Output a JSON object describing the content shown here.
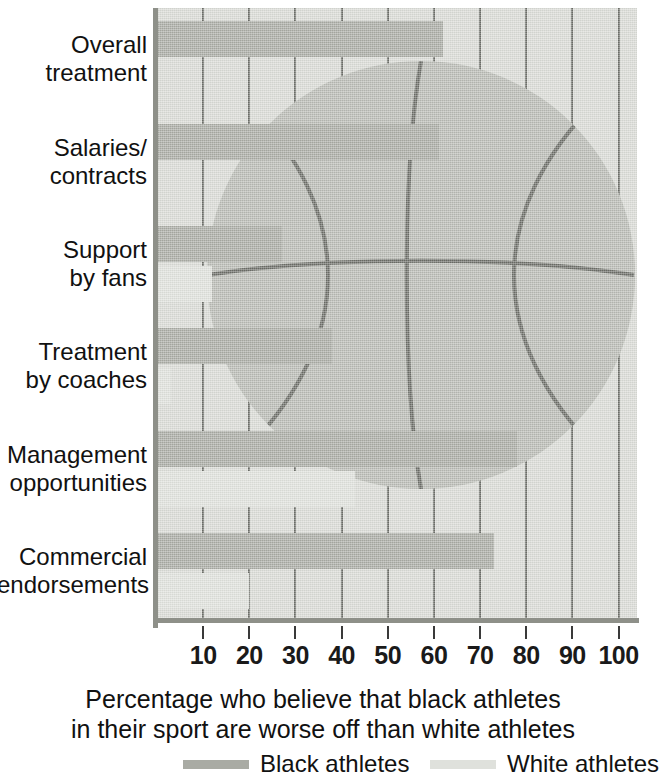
{
  "chart_data": {
    "type": "bar",
    "orientation": "horizontal",
    "title": "",
    "subtitle": "",
    "xlabel": "Percentage who believe that black athletes in their sport are worse off than white athletes",
    "ylabel": "",
    "xlim": [
      0,
      104
    ],
    "xticks": [
      10,
      20,
      30,
      40,
      50,
      60,
      70,
      80,
      90,
      100
    ],
    "xticklabels": [
      "10",
      "20",
      "30",
      "40",
      "50",
      "60",
      "70",
      "80",
      "90",
      "100"
    ],
    "grid": true,
    "grid_axis": "x",
    "legend_position": "bottom",
    "categories": [
      "Overall\ntreatment",
      "Salaries/\ncontracts",
      "Support\nby fans",
      "Treatment\nby coaches",
      "Management\nopportunities",
      "Commercial\nendorsements"
    ],
    "series": [
      {
        "name": "Black athletes",
        "color": "#a9aba4",
        "values": [
          62,
          61,
          27,
          38,
          78,
          73
        ]
      },
      {
        "name": "White athletes",
        "color": "#dfe1dc",
        "values": [
          0,
          0,
          12,
          3,
          43,
          20
        ]
      }
    ]
  },
  "caption": {
    "line1": "Percentage who believe that black athletes",
    "line2": "in their sport are worse off than white athletes"
  },
  "legend": {
    "items": [
      {
        "label": "Black athletes",
        "color": "#a9aba4"
      },
      {
        "label": "White athletes",
        "color": "#dfe1dc"
      }
    ]
  },
  "decoration": {
    "image": "basketball-illustration"
  }
}
